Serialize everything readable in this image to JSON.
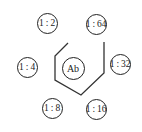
{
  "diagram": {
    "type": "immunodiffusion-pattern",
    "center_well": {
      "label": "Ab",
      "x": 73,
      "y": 68
    },
    "peripheral_wells": [
      {
        "label": "1 : 2",
        "x": 47,
        "y": 23
      },
      {
        "label": "1 : 64",
        "x": 96,
        "y": 24
      },
      {
        "label": "1 : 4",
        "x": 27,
        "y": 67
      },
      {
        "label": "1 : 32",
        "x": 120,
        "y": 64
      },
      {
        "label": "1 : 8",
        "x": 52,
        "y": 108
      },
      {
        "label": "1 : 16",
        "x": 96,
        "y": 109
      }
    ],
    "precipitin_line_points": "68,43 55,56 55,80 81,95 104,73 104,42",
    "line_color": "#333333"
  }
}
